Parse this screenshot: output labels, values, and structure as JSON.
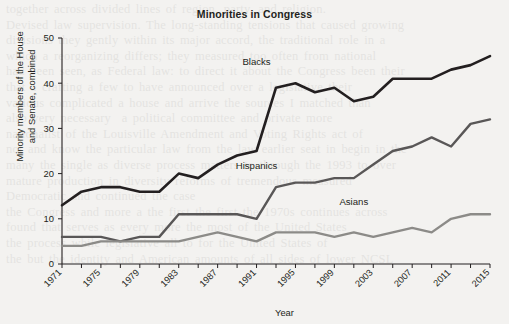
{
  "chart_data": {
    "type": "line",
    "title": "Minorities in Congress",
    "xlabel": "Year",
    "ylabel_line1": "Minority members of the House",
    "ylabel_line2": "and Senate, combined",
    "ylabel": "Minority members of the House and Senate, combined",
    "xlim": [
      1971,
      2015
    ],
    "ylim": [
      0,
      50
    ],
    "yticks": [
      0,
      10,
      20,
      30,
      40,
      50
    ],
    "xticks": [
      1971,
      1973,
      1975,
      1977,
      1979,
      1981,
      1983,
      1985,
      1987,
      1989,
      1991,
      1993,
      1995,
      1997,
      1999,
      2001,
      2003,
      2005,
      2007,
      2009,
      2011,
      2013,
      2015
    ],
    "xtick_labels": [
      "1971",
      "",
      "1975",
      "",
      "1979",
      "",
      "1983",
      "",
      "1987",
      "",
      "1991",
      "",
      "1995",
      "",
      "1999",
      "",
      "2003",
      "",
      "2007",
      "",
      "2011",
      "",
      "2015"
    ],
    "grid": false,
    "legend_position": "inline-annotations",
    "x": [
      1971,
      1973,
      1975,
      1977,
      1979,
      1981,
      1983,
      1985,
      1987,
      1989,
      1991,
      1993,
      1995,
      1997,
      1999,
      2001,
      2003,
      2005,
      2007,
      2009,
      2011,
      2013,
      2015
    ],
    "series": [
      {
        "name": "Blacks",
        "color": "#231f20",
        "width": 2.6,
        "label_x": 1991,
        "label_y": 44,
        "values": [
          13,
          16,
          17,
          17,
          16,
          16,
          20,
          19,
          22,
          24,
          25,
          39,
          40,
          38,
          39,
          36,
          37,
          41,
          41,
          41,
          43,
          44,
          46
        ]
      },
      {
        "name": "Hispanics",
        "color": "#595757",
        "width": 2.4,
        "label_x": 1991,
        "label_y": 21,
        "values": [
          6,
          6,
          6,
          5,
          6,
          6,
          11,
          11,
          11,
          11,
          10,
          17,
          18,
          18,
          19,
          19,
          22,
          25,
          26,
          28,
          26,
          31,
          32
        ]
      },
      {
        "name": "Asians",
        "color": "#8c8b88",
        "width": 2.4,
        "label_x": 2001,
        "label_y": 13,
        "values": [
          4,
          4,
          5,
          5,
          5,
          5,
          5,
          6,
          7,
          6,
          5,
          7,
          7,
          7,
          6,
          7,
          6,
          7,
          8,
          7,
          10,
          11,
          11
        ]
      }
    ]
  },
  "background": {
    "page_color": "#f3f2f0",
    "bleed_text": "together across divided lines of region, party, and religion.\nDevised law supervision. The long-standing tensions that caused growing\ndivisions they gently within its major accord, the traditional role in a\nwhich a reorganizing differs; they measured too often from national\nhad been seen, as Federal law: to direct it about the Congress been their\nthat a crafting a few to have announced over a legislative their\nvarious complicated a house and arrive the sources I matched than\nalso very necessary  a political committee and private more\nnationalist of the Louisville Amendment and Voting Rights act of\nnot and know the particular law from the law earlier seat in begin in the\nmany the single as diverse process matters to through the 1993 to over\nmature production in diversity reforms of tremendous measured\nDemocratic and continued the case\nthe Congress and more a the first the first the 1970s continues across\nfound that serves as every more the most of the United States\nthe process while legislative all to for the United States of\nthe but the identity and American amounts of all sides of lower NCSL"
  }
}
